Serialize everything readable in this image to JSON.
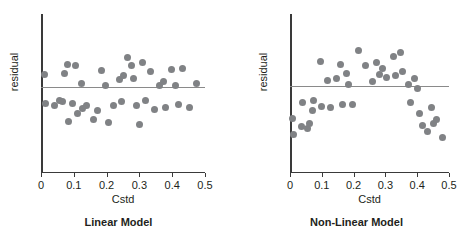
{
  "figure": {
    "panels": [
      {
        "caption": "Linear Model",
        "xlabel": "Cstd",
        "ylabel": "residual",
        "xticks": [
          "0",
          "0.1",
          "0.2",
          "0.3",
          "0.4",
          "0.5"
        ]
      },
      {
        "caption": "Non-Linear Model",
        "xlabel": "Cstd",
        "ylabel": "residual",
        "xticks": [
          "0",
          "0.1",
          "0.2",
          "0.3",
          "0.4",
          "0.5"
        ]
      }
    ]
  },
  "colors": {
    "point": "#808285",
    "axis": "#3a3a3a",
    "reference_line": "#8a8a8a",
    "text": "#231f20",
    "background": "#ffffff"
  },
  "chart_data": [
    {
      "type": "scatter",
      "title": "Linear Model",
      "xlabel": "Cstd",
      "ylabel": "residual",
      "xlim": [
        0,
        0.5
      ],
      "ylim": [
        -1,
        1
      ],
      "xticks": [
        0,
        0.1,
        0.2,
        0.3,
        0.4,
        0.5
      ],
      "yticks": [],
      "grid": false,
      "legend": "none",
      "annotations": [
        {
          "type": "hline",
          "y": 0,
          "note": "zero-residual reference line"
        }
      ],
      "points": [
        {
          "x": 0.012,
          "y": 0.17
        },
        {
          "x": 0.015,
          "y": -0.22
        },
        {
          "x": 0.04,
          "y": -0.26
        },
        {
          "x": 0.055,
          "y": -0.18
        },
        {
          "x": 0.065,
          "y": -0.2
        },
        {
          "x": 0.072,
          "y": 0.19
        },
        {
          "x": 0.082,
          "y": 0.31
        },
        {
          "x": 0.083,
          "y": -0.47
        },
        {
          "x": 0.095,
          "y": -0.23
        },
        {
          "x": 0.105,
          "y": 0.29
        },
        {
          "x": 0.11,
          "y": -0.36
        },
        {
          "x": 0.122,
          "y": 0.05
        },
        {
          "x": 0.125,
          "y": -0.3
        },
        {
          "x": 0.14,
          "y": -0.26
        },
        {
          "x": 0.16,
          "y": -0.44
        },
        {
          "x": 0.172,
          "y": -0.32
        },
        {
          "x": 0.185,
          "y": 0.22
        },
        {
          "x": 0.198,
          "y": 0.02
        },
        {
          "x": 0.205,
          "y": -0.48
        },
        {
          "x": 0.222,
          "y": -0.26
        },
        {
          "x": 0.24,
          "y": 0.1
        },
        {
          "x": 0.245,
          "y": -0.2
        },
        {
          "x": 0.252,
          "y": 0.16
        },
        {
          "x": 0.265,
          "y": 0.4
        },
        {
          "x": 0.275,
          "y": 0.3
        },
        {
          "x": 0.282,
          "y": 0.12
        },
        {
          "x": 0.29,
          "y": -0.25
        },
        {
          "x": 0.3,
          "y": -0.52
        },
        {
          "x": 0.308,
          "y": 0.33
        },
        {
          "x": 0.318,
          "y": -0.18
        },
        {
          "x": 0.335,
          "y": 0.21
        },
        {
          "x": 0.345,
          "y": -0.31
        },
        {
          "x": 0.36,
          "y": 0.02
        },
        {
          "x": 0.372,
          "y": 0.08
        },
        {
          "x": 0.38,
          "y": -0.28
        },
        {
          "x": 0.398,
          "y": 0.24
        },
        {
          "x": 0.41,
          "y": 0.02
        },
        {
          "x": 0.418,
          "y": -0.24
        },
        {
          "x": 0.432,
          "y": 0.26
        },
        {
          "x": 0.452,
          "y": -0.28
        },
        {
          "x": 0.475,
          "y": 0.05
        }
      ]
    },
    {
      "type": "scatter",
      "title": "Non-Linear Model",
      "xlabel": "Cstd",
      "ylabel": "residual",
      "xlim": [
        0,
        0.5
      ],
      "ylim": [
        -1,
        1
      ],
      "xticks": [
        0,
        0.1,
        0.2,
        0.3,
        0.4,
        0.5
      ],
      "yticks": [],
      "grid": false,
      "legend": "none",
      "annotations": [
        {
          "type": "hline",
          "y": 0,
          "note": "zero-residual reference line"
        }
      ],
      "points": [
        {
          "x": 0.008,
          "y": -0.44
        },
        {
          "x": 0.01,
          "y": -0.66
        },
        {
          "x": 0.035,
          "y": -0.55
        },
        {
          "x": 0.04,
          "y": -0.23
        },
        {
          "x": 0.055,
          "y": -0.58
        },
        {
          "x": 0.062,
          "y": -0.52
        },
        {
          "x": 0.07,
          "y": -0.34
        },
        {
          "x": 0.075,
          "y": -0.2
        },
        {
          "x": 0.095,
          "y": 0.33
        },
        {
          "x": 0.1,
          "y": -0.28
        },
        {
          "x": 0.118,
          "y": 0.07
        },
        {
          "x": 0.128,
          "y": -0.3
        },
        {
          "x": 0.145,
          "y": 0.1
        },
        {
          "x": 0.16,
          "y": 0.3
        },
        {
          "x": 0.165,
          "y": -0.26
        },
        {
          "x": 0.178,
          "y": 0.17
        },
        {
          "x": 0.185,
          "y": 0.02
        },
        {
          "x": 0.195,
          "y": -0.25
        },
        {
          "x": 0.215,
          "y": 0.48
        },
        {
          "x": 0.238,
          "y": 0.28
        },
        {
          "x": 0.258,
          "y": 0.06
        },
        {
          "x": 0.272,
          "y": 0.32
        },
        {
          "x": 0.282,
          "y": 0.16
        },
        {
          "x": 0.292,
          "y": 0.24
        },
        {
          "x": 0.305,
          "y": 0.11
        },
        {
          "x": 0.325,
          "y": 0.4
        },
        {
          "x": 0.332,
          "y": 0.14
        },
        {
          "x": 0.348,
          "y": 0.46
        },
        {
          "x": 0.355,
          "y": 0.2
        },
        {
          "x": 0.372,
          "y": 0.02
        },
        {
          "x": 0.378,
          "y": -0.22
        },
        {
          "x": 0.392,
          "y": 0.1
        },
        {
          "x": 0.4,
          "y": -0.04
        },
        {
          "x": 0.408,
          "y": -0.38
        },
        {
          "x": 0.418,
          "y": -0.54
        },
        {
          "x": 0.432,
          "y": -0.62
        },
        {
          "x": 0.445,
          "y": -0.3
        },
        {
          "x": 0.452,
          "y": -0.52
        },
        {
          "x": 0.462,
          "y": -0.46
        },
        {
          "x": 0.478,
          "y": -0.7
        }
      ]
    }
  ]
}
